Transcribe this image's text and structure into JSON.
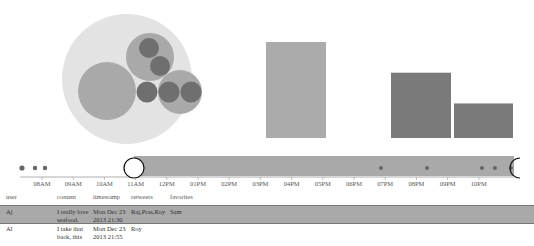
{
  "colors": {
    "pack_outer": "#e3e3e3",
    "pack_mid": "#a9a9a9",
    "pack_inner": "#6f6f6f",
    "bar_light": "#ababab",
    "bar_dark": "#7a7a7a",
    "timeline_band": "#a9a9a9",
    "dot": "#666666",
    "row_selected": "#a9a9a9"
  },
  "bubble_pack": {
    "groups": [
      {
        "name": "group-large",
        "leaves": 0
      },
      {
        "name": "group-top",
        "leaves": 2
      },
      {
        "name": "group-single",
        "leaves": 1
      },
      {
        "name": "group-right",
        "leaves": 2
      }
    ]
  },
  "chart_data": {
    "type": "bar",
    "title": "",
    "xlabel": "",
    "ylabel": "",
    "categories": [
      "03PM-04PM",
      "07PM-08PM",
      "09PM-10PM"
    ],
    "series": [
      {
        "name": "tweets",
        "values": [
          100,
          68,
          36
        ]
      }
    ],
    "ylim": [
      0,
      100
    ]
  },
  "timeline": {
    "ticks": [
      "08AM",
      "09AM",
      "10AM",
      "11AM",
      "12PM",
      "01PM",
      "02PM",
      "03PM",
      "04PM",
      "05PM",
      "06PM",
      "07PM",
      "08PM",
      "09PM",
      "10PM"
    ],
    "brush_start": "11AM",
    "brush_end": "10PM+",
    "event_dots": [
      "07:30AM",
      "07:45AM",
      "07:55AM",
      "11:05AM",
      "06:40PM",
      "08:00PM",
      "09:45PM",
      "10:00PM",
      "10:20PM"
    ]
  },
  "table": {
    "headers": [
      "user",
      "content",
      "timestamp",
      "retweets",
      "favorites"
    ],
    "rows": [
      {
        "user": "Aj",
        "content_line1": "I really love",
        "content_line2": "seafood.",
        "ts_line1": "Mon Dec 23",
        "ts_line2": "2013 21:30",
        "retweets": "Raj,Pras,Roy",
        "favorites": "Sam",
        "selected": true
      },
      {
        "user": "Al",
        "content_line1": "I take that",
        "content_line2": "back, this",
        "ts_line1": "Mon Dec 23",
        "ts_line2": "2013 21:55",
        "retweets": "Roy",
        "favorites": "",
        "selected": false
      }
    ]
  }
}
